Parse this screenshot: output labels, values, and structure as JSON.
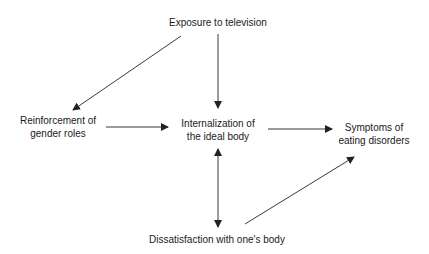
{
  "diagram": {
    "type": "flow",
    "nodes": {
      "exposure": {
        "lines": [
          "Exposure to television"
        ]
      },
      "reinforcement": {
        "lines": [
          "Reinforcement of",
          "gender roles"
        ]
      },
      "internalization": {
        "lines": [
          "Internalization of",
          "the ideal body"
        ]
      },
      "symptoms": {
        "lines": [
          "Symptoms of",
          "eating disorders"
        ]
      },
      "dissatisfaction": {
        "lines": [
          "Dissatisfaction with one's body"
        ]
      }
    },
    "edges": [
      {
        "from": "Exposure to television",
        "to": "Reinforcement of gender roles",
        "direction": "forward"
      },
      {
        "from": "Exposure to television",
        "to": "Internalization of the ideal body",
        "direction": "forward"
      },
      {
        "from": "Reinforcement of gender roles",
        "to": "Internalization of the ideal body",
        "direction": "forward"
      },
      {
        "from": "Internalization of the ideal body",
        "to": "Symptoms of eating disorders",
        "direction": "forward"
      },
      {
        "from": "Internalization of the ideal body",
        "to": "Dissatisfaction with one's body",
        "direction": "bidirectional"
      },
      {
        "from": "Dissatisfaction with one's body",
        "to": "Symptoms of eating disorders",
        "direction": "forward"
      }
    ],
    "colors": {
      "line": "#222222",
      "text": "#1a1a1a",
      "background": "#ffffff"
    }
  }
}
